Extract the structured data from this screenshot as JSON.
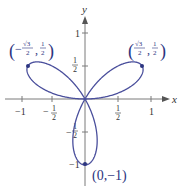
{
  "chart_data": {
    "type": "line",
    "subtype": "polar-curve",
    "equation": "r = sin(3θ)",
    "title": "",
    "xlabel": "x",
    "ylabel": "y",
    "xlim": [
      -1.2,
      1.2
    ],
    "ylim": [
      -1.15,
      1.2
    ],
    "grid": false,
    "x_ticks": [
      {
        "value": -1,
        "label": "−1"
      },
      {
        "value": -0.5,
        "label": "−1/2"
      },
      {
        "value": 0.5,
        "label": "1/2"
      },
      {
        "value": 1,
        "label": "1"
      }
    ],
    "y_ticks": [
      {
        "value": 1,
        "label": "1"
      },
      {
        "value": 0.5,
        "label": "1/2"
      },
      {
        "value": -0.5,
        "label": "−1/2"
      },
      {
        "value": -1,
        "label": "−1"
      }
    ],
    "marked_points": [
      {
        "x": -0.866,
        "y": 0.5,
        "label": "(−√3/2, 1/2)"
      },
      {
        "x": 0.866,
        "y": 0.5,
        "label": "(√3/2, 1/2)"
      },
      {
        "x": 0,
        "y": -1,
        "label": "(0,−1)"
      }
    ],
    "curve_color": "#4a4f9c",
    "point_color": "#2c3580"
  },
  "labels": {
    "x_axis": "x",
    "y_axis": "y",
    "tick_x_neg1": "−1",
    "tick_x_pos1": "1",
    "tick_y_pos1": "1",
    "tick_y_neg1": "−1",
    "frac_num": "1",
    "frac_den": "2",
    "minus": "−",
    "point_bottom": "(0,−1)",
    "sqrt3": "√3",
    "comma": ","
  }
}
